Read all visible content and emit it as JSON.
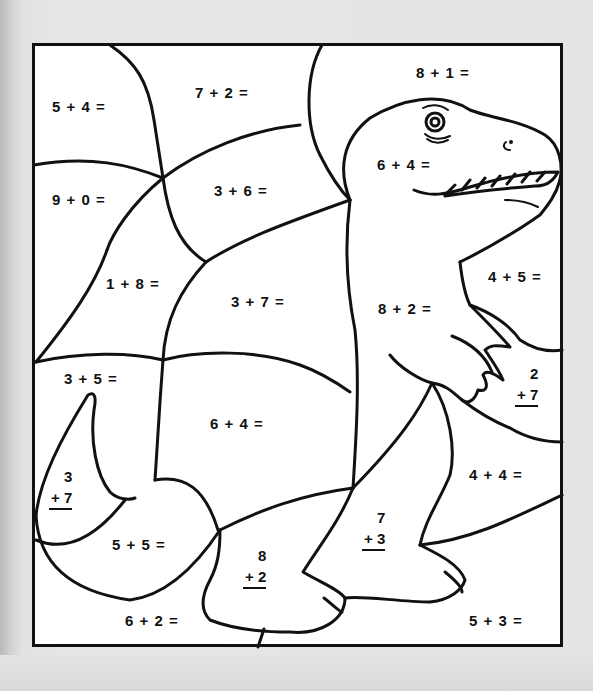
{
  "worksheet": {
    "type": "color-by-number math addition worksheet",
    "picture": "T-rex dinosaur",
    "colors": {
      "background": "#e4e4e4",
      "paper": "#ffffff",
      "ink": "#111111"
    },
    "problems": [
      {
        "id": "p1",
        "format": "horizontal",
        "text": "5 + 4 =",
        "x": 52,
        "y": 98
      },
      {
        "id": "p2",
        "format": "horizontal",
        "text": "7 + 2 =",
        "x": 195,
        "y": 84
      },
      {
        "id": "p3",
        "format": "horizontal",
        "text": "8 + 1 =",
        "x": 416,
        "y": 64
      },
      {
        "id": "p4",
        "format": "horizontal",
        "text": "6 + 4 =",
        "x": 377,
        "y": 156
      },
      {
        "id": "p5",
        "format": "horizontal",
        "text": "9 + 0 =",
        "x": 52,
        "y": 191
      },
      {
        "id": "p6",
        "format": "horizontal",
        "text": "3 + 6 =",
        "x": 214,
        "y": 182
      },
      {
        "id": "p7",
        "format": "horizontal",
        "text": "1 + 8 =",
        "x": 106,
        "y": 275
      },
      {
        "id": "p8",
        "format": "horizontal",
        "text": "3 + 7 =",
        "x": 231,
        "y": 293
      },
      {
        "id": "p9",
        "format": "horizontal",
        "text": "8 + 2 =",
        "x": 378,
        "y": 300
      },
      {
        "id": "p10",
        "format": "horizontal",
        "text": "4 + 5 =",
        "x": 488,
        "y": 268
      },
      {
        "id": "p11",
        "format": "horizontal",
        "text": "3 + 5 =",
        "x": 64,
        "y": 370
      },
      {
        "id": "p12",
        "format": "horizontal",
        "text": "6 + 4 =",
        "x": 210,
        "y": 415
      },
      {
        "id": "p13",
        "format": "vertical",
        "top": "2",
        "bottom": "+ 7",
        "x": 515,
        "y": 363
      },
      {
        "id": "p14",
        "format": "horizontal",
        "text": "4 + 4 =",
        "x": 469,
        "y": 466
      },
      {
        "id": "p15",
        "format": "vertical",
        "top": "3",
        "bottom": "+ 7",
        "x": 49,
        "y": 466
      },
      {
        "id": "p16",
        "format": "horizontal",
        "text": "5 + 5 =",
        "x": 112,
        "y": 536
      },
      {
        "id": "p17",
        "format": "vertical",
        "top": "7",
        "bottom": "+ 3",
        "x": 362,
        "y": 507
      },
      {
        "id": "p18",
        "format": "vertical",
        "top": "8",
        "bottom": "+ 2",
        "x": 243,
        "y": 545
      },
      {
        "id": "p19",
        "format": "horizontal",
        "text": "6 + 2 =",
        "x": 125,
        "y": 612
      },
      {
        "id": "p20",
        "format": "horizontal",
        "text": "5 + 3 =",
        "x": 469,
        "y": 612
      }
    ]
  }
}
